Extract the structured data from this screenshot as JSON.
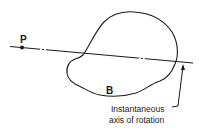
{
  "diagram": {
    "point_label": "P",
    "body_label": "B",
    "annotation_line1": "Instantaneous",
    "annotation_line2": "axis of rotation",
    "stroke_color": "#1a1a1a",
    "background_color": "#ffffff"
  }
}
